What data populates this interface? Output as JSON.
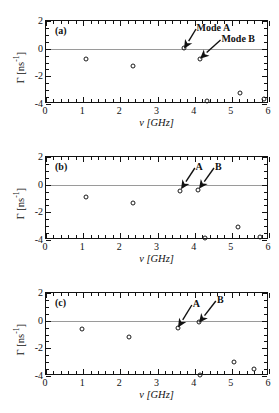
{
  "figure": {
    "panels": [
      {
        "id": "a",
        "label": "(a)",
        "xaxis": {
          "title": "ν [GHz]",
          "min": 0,
          "max": 6,
          "ticks": [
            "0",
            "1",
            "2",
            "3",
            "4",
            "5",
            "6"
          ]
        },
        "yaxis": {
          "title": "Γ [ns",
          "title_sup": "-1",
          "title_end": "]",
          "min": -4,
          "max": 2,
          "ticks": [
            "2",
            "0",
            "-2",
            "-4"
          ]
        },
        "annotations": [
          {
            "name": "mode-a",
            "text": "Mode A",
            "x": 4.05,
            "y": 1.52,
            "tip_x": 3.7,
            "tip_y": 0.02
          },
          {
            "name": "mode-b",
            "text": "Mode B",
            "x": 4.72,
            "y": 0.72,
            "tip_x": 4.14,
            "tip_y": -0.7
          }
        ],
        "points": [
          {
            "x": 1.07,
            "y": -0.72
          },
          {
            "x": 2.33,
            "y": -1.22
          },
          {
            "x": 3.7,
            "y": 0.02
          },
          {
            "x": 4.14,
            "y": -0.72
          },
          {
            "x": 4.33,
            "y": -3.76
          },
          {
            "x": 5.22,
            "y": -3.17
          },
          {
            "x": 5.87,
            "y": -3.66
          }
        ]
      },
      {
        "id": "b",
        "label": "(b)",
        "xaxis": {
          "title": "ν [GHz]",
          "min": 0,
          "max": 6,
          "ticks": [
            "0",
            "1",
            "2",
            "3",
            "4",
            "5",
            "6"
          ]
        },
        "yaxis": {
          "title": "Γ [ns",
          "title_sup": "-1",
          "title_end": "]",
          "min": -4,
          "max": 2,
          "ticks": [
            "2",
            "0",
            "-2",
            "-4"
          ]
        },
        "annotations": [
          {
            "name": "mode-a",
            "text": "A",
            "x": 4.02,
            "y": 1.3,
            "tip_x": 3.62,
            "tip_y": -0.3
          },
          {
            "name": "mode-b",
            "text": "B",
            "x": 4.55,
            "y": 1.3,
            "tip_x": 4.12,
            "tip_y": -0.28
          }
        ],
        "points": [
          {
            "x": 1.07,
            "y": -0.88
          },
          {
            "x": 2.35,
            "y": -1.35
          },
          {
            "x": 3.6,
            "y": -0.45
          },
          {
            "x": 4.08,
            "y": -0.4
          },
          {
            "x": 4.27,
            "y": -3.88
          },
          {
            "x": 5.17,
            "y": -3.07
          },
          {
            "x": 5.75,
            "y": -3.77
          }
        ]
      },
      {
        "id": "c",
        "label": "(c)",
        "xaxis": {
          "title": "ν [GHz]",
          "min": 0,
          "max": 6,
          "ticks": [
            "0",
            "1",
            "2",
            "3",
            "4",
            "5",
            "6"
          ]
        },
        "yaxis": {
          "title": "Γ [ns",
          "title_sup": "-1",
          "title_end": "]",
          "min": -4,
          "max": 2,
          "ticks": [
            "2",
            "0",
            "-2",
            "-4"
          ]
        },
        "annotations": [
          {
            "name": "mode-a",
            "text": "A",
            "x": 3.95,
            "y": 1.18,
            "tip_x": 3.55,
            "tip_y": -0.52
          },
          {
            "name": "mode-b",
            "text": "B",
            "x": 4.6,
            "y": 1.52,
            "tip_x": 4.12,
            "tip_y": -0.12
          }
        ],
        "points": [
          {
            "x": 0.98,
            "y": -0.62
          },
          {
            "x": 2.23,
            "y": -1.18
          },
          {
            "x": 3.55,
            "y": -0.55
          },
          {
            "x": 4.11,
            "y": -0.13
          },
          {
            "x": 4.15,
            "y": -3.92
          },
          {
            "x": 5.05,
            "y": -2.98
          },
          {
            "x": 5.6,
            "y": -3.52
          }
        ]
      }
    ],
    "colors": {
      "axis": "#111111",
      "zero_line": "#9a9a9a",
      "marker": "#1a1a1a",
      "background": "#ffffff"
    }
  }
}
